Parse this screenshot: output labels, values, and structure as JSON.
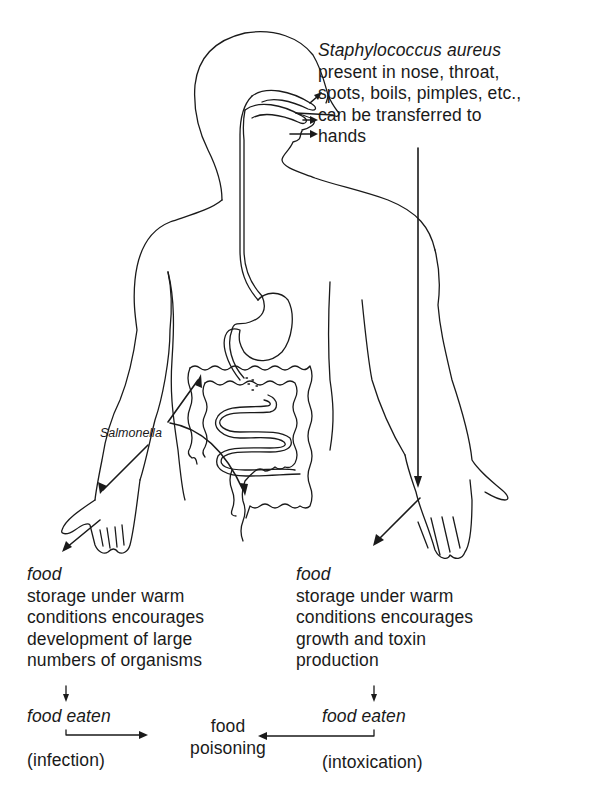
{
  "diagram": {
    "staph_block": {
      "organism": "Staphylococcus aureus",
      "lines": [
        "present in nose, throat,",
        "spots, boils, pimples, etc.,",
        "can be transferred to",
        "hands"
      ]
    },
    "salmonella_label": "Salmonella",
    "left_branch": {
      "heading": "food",
      "lines": [
        "storage under warm",
        "conditions encourages",
        "development of large",
        "numbers of organisms"
      ],
      "eaten": "food eaten",
      "type": "(infection)"
    },
    "right_branch": {
      "heading": "food",
      "lines": [
        "storage under warm",
        "conditions encourages",
        "growth and toxin",
        "production"
      ],
      "eaten": "food eaten",
      "type": "(intoxication)"
    },
    "outcome": {
      "line1": "food",
      "line2": "poisoning"
    },
    "colors": {
      "ink": "#1a1a1a",
      "paper": "#ffffff"
    }
  }
}
